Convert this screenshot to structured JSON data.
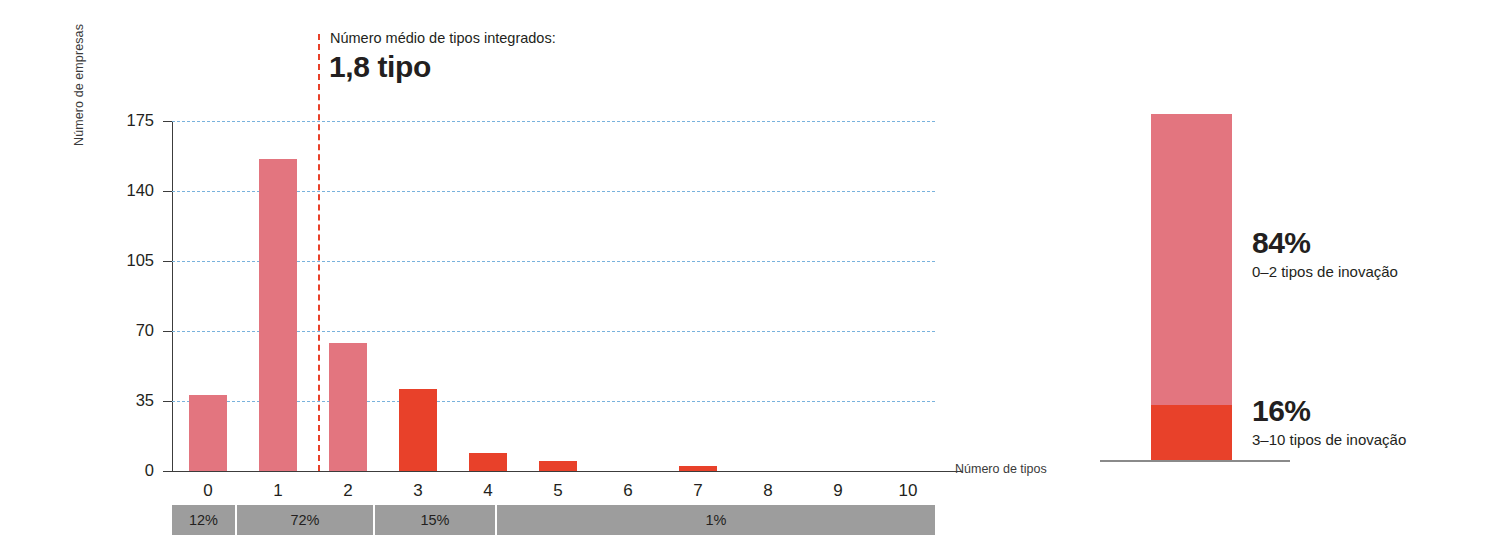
{
  "chart_data": {
    "type": "bar",
    "title": "",
    "xlabel": "Número de tipos",
    "ylabel": "Número de empresas",
    "categories": [
      "0",
      "1",
      "2",
      "3",
      "4",
      "5",
      "6",
      "7",
      "8",
      "9",
      "10"
    ],
    "values": [
      38,
      156,
      64,
      41,
      9,
      5,
      0,
      2.5,
      0,
      0,
      0
    ],
    "ylim": [
      0,
      175
    ],
    "yticks": [
      0,
      35,
      70,
      105,
      140,
      175
    ],
    "ytick_labels": [
      "0",
      "35",
      "70",
      "105",
      "140",
      "175"
    ],
    "grid": "horizontal-dashed",
    "legend": "none",
    "bar_colors": [
      "#e3757f",
      "#e3757f",
      "#e3757f",
      "#e8412a",
      "#e8412a",
      "#e8412a",
      "#e8412a",
      "#e8412a",
      "#e8412a",
      "#e8412a",
      "#e8412a"
    ],
    "annotations": {
      "mean_caption": "Número médio de tipos integrados:",
      "mean_value": "1,8 tipo",
      "mean_x": 1.8
    },
    "percent_band": [
      {
        "label": "12%",
        "span": "0",
        "width_frac": 0.085
      },
      {
        "label": "72%",
        "span": "1",
        "width_frac": 0.181
      },
      {
        "label": "15%",
        "span": "2-3",
        "width_frac": 0.16
      },
      {
        "label": "1%",
        "span": "4-10",
        "width_frac": 0.574
      }
    ],
    "secondary": {
      "type": "bar",
      "stacked": true,
      "segments": [
        {
          "percent": "84%",
          "description": "0–2 tipos de inovação",
          "value": 84,
          "color": "#e3757f"
        },
        {
          "percent": "16%",
          "description": "3–10 tipos de inovação",
          "value": 16,
          "color": "#e8412a"
        }
      ]
    }
  },
  "colors": {
    "pink": "#e3757f",
    "red": "#e8412a",
    "gridline": "#79b2dc",
    "band_gray": "#9d9d9d",
    "axis": "#3c3c3c",
    "text": "#231f20"
  }
}
